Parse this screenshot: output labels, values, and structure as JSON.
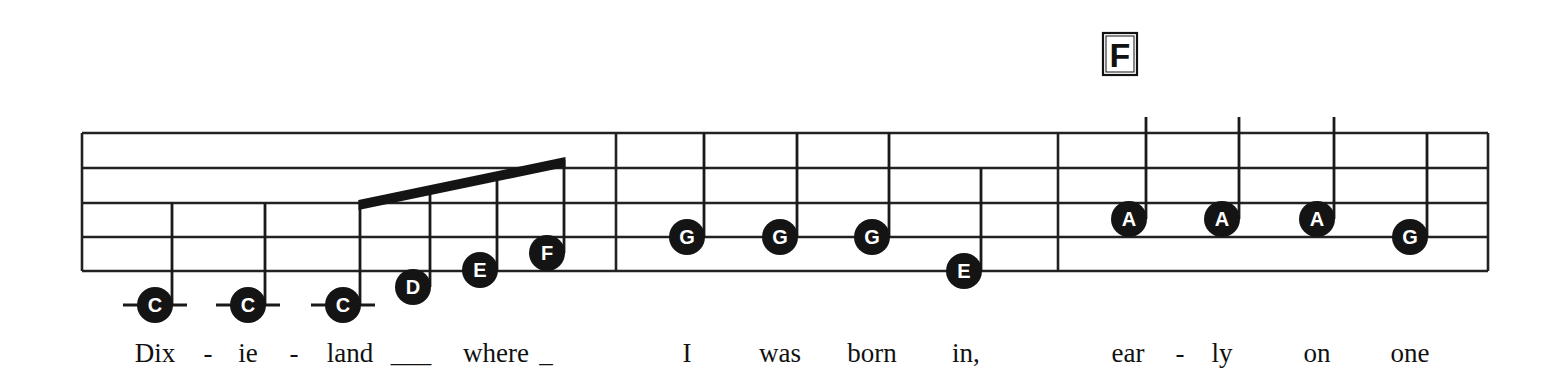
{
  "chord": {
    "label": "F",
    "x": 1120
  },
  "staff": {
    "left": 82,
    "right": 1488,
    "lines_y": [
      133,
      168,
      203,
      237,
      271
    ],
    "barlines_x": [
      616,
      1058
    ]
  },
  "measures": [
    {
      "notes": [
        {
          "letter": "C",
          "x": 155,
          "y": 305,
          "ledger": true,
          "stem_top": 203
        },
        {
          "letter": "C",
          "x": 248,
          "y": 305,
          "ledger": true,
          "stem_top": 203
        },
        {
          "letter": "C",
          "x": 343,
          "y": 305,
          "ledger": true,
          "stem_top": 200,
          "beamed": true
        },
        {
          "letter": "D",
          "x": 413,
          "y": 287,
          "stem_top": 187,
          "beamed": true
        },
        {
          "letter": "E",
          "x": 480,
          "y": 270,
          "stem_top": 174,
          "beamed": true
        },
        {
          "letter": "F",
          "x": 547,
          "y": 253,
          "stem_top": 160,
          "beamed": true
        }
      ]
    },
    {
      "notes": [
        {
          "letter": "G",
          "x": 687,
          "y": 237,
          "stem_top": 133
        },
        {
          "letter": "G",
          "x": 780,
          "y": 237,
          "stem_top": 133
        },
        {
          "letter": "G",
          "x": 872,
          "y": 237,
          "stem_top": 133
        },
        {
          "letter": "E",
          "x": 964,
          "y": 271,
          "stem_top": 168
        }
      ]
    },
    {
      "notes": [
        {
          "letter": "A",
          "x": 1129,
          "y": 219,
          "stem_top": 117
        },
        {
          "letter": "A",
          "x": 1222,
          "y": 219,
          "stem_top": 117
        },
        {
          "letter": "A",
          "x": 1317,
          "y": 219,
          "stem_top": 117
        },
        {
          "letter": "G",
          "x": 1410,
          "y": 237,
          "stem_top": 133
        }
      ]
    }
  ],
  "lyrics": [
    {
      "text": "Dix",
      "x": 155
    },
    {
      "text": "-",
      "x": 208
    },
    {
      "text": "ie",
      "x": 248
    },
    {
      "text": "-",
      "x": 294
    },
    {
      "text": "land",
      "x": 350
    },
    {
      "text": "___",
      "x": 411
    },
    {
      "text": "where",
      "x": 496
    },
    {
      "text": "_",
      "x": 546
    },
    {
      "text": "I",
      "x": 687
    },
    {
      "text": "was",
      "x": 780
    },
    {
      "text": "born",
      "x": 872
    },
    {
      "text": "in,",
      "x": 966
    },
    {
      "text": "ear",
      "x": 1128
    },
    {
      "text": "-",
      "x": 1180
    },
    {
      "text": "ly",
      "x": 1222
    },
    {
      "text": "on",
      "x": 1317
    },
    {
      "text": "one",
      "x": 1410
    }
  ]
}
